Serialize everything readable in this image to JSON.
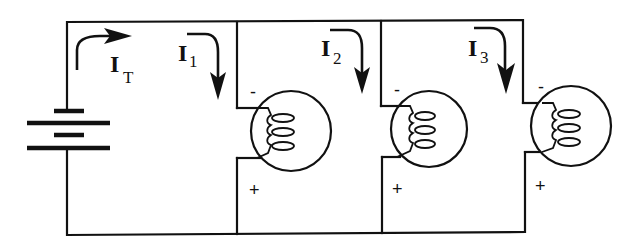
{
  "diagram": {
    "currents": {
      "total": {
        "symbol": "I",
        "subscript": "T"
      },
      "branch1": {
        "symbol": "I",
        "subscript": "1"
      },
      "branch2": {
        "symbol": "I",
        "subscript": "2"
      },
      "branch3": {
        "symbol": "I",
        "subscript": "3"
      }
    },
    "lamps": [
      {
        "name": "lamp-1",
        "top_polarity": "-",
        "bottom_polarity": "+"
      },
      {
        "name": "lamp-2",
        "top_polarity": "-",
        "bottom_polarity": "+"
      },
      {
        "name": "lamp-3",
        "top_polarity": "-",
        "bottom_polarity": "+"
      }
    ],
    "colors": {
      "ink": "#111111",
      "background": "#ffffff"
    }
  }
}
